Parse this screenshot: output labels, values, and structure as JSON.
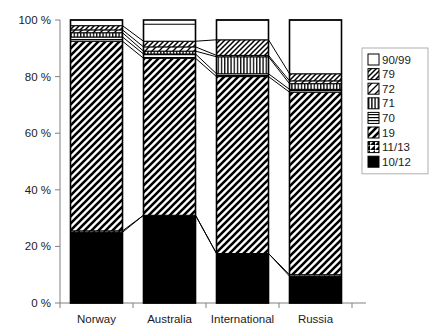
{
  "chart_data": {
    "type": "bar",
    "subtype": "stacked-100-percent",
    "title": "",
    "xlabel": "",
    "ylabel": "",
    "ylim": [
      0,
      100
    ],
    "ytick_labels": [
      "0 %",
      "20 %",
      "40 %",
      "60 %",
      "80 %",
      "100 %"
    ],
    "ytick_values": [
      0,
      20,
      40,
      60,
      80,
      100
    ],
    "grid": false,
    "legend_position": "right",
    "categories": [
      "Norway",
      "Australia",
      "International",
      "Russia"
    ],
    "series": [
      {
        "name": "10/12",
        "pattern": "solid-black",
        "values": [
          25.0,
          31.0,
          17.5,
          9.5
        ]
      },
      {
        "name": "11/13",
        "pattern": "diagonal-half-fill",
        "values": [
          0.5,
          0.0,
          0.0,
          0.5
        ]
      },
      {
        "name": "19",
        "pattern": "diagonal-hatch-dense",
        "values": [
          67.0,
          55.5,
          62.5,
          64.5
        ]
      },
      {
        "name": "70",
        "pattern": "horizontal-lines",
        "values": [
          1.5,
          1.5,
          1.0,
          1.0
        ]
      },
      {
        "name": "71",
        "pattern": "vertical-lines",
        "values": [
          1.5,
          1.0,
          6.0,
          2.0
        ]
      },
      {
        "name": "72",
        "pattern": "diagonal-light",
        "values": [
          1.0,
          1.5,
          0.5,
          1.0
        ]
      },
      {
        "name": "79",
        "pattern": "diagonal-hatch-fine",
        "values": [
          1.5,
          2.0,
          5.5,
          2.5
        ]
      },
      {
        "name": "90/99",
        "pattern": "white-empty",
        "values": [
          2.0,
          6.0,
          7.0,
          19.0
        ]
      }
    ],
    "legend_entries": [
      {
        "label": "90/99",
        "pattern": "white-empty"
      },
      {
        "label": "79",
        "pattern": "diagonal-hatch-fine"
      },
      {
        "label": "72",
        "pattern": "diagonal-light"
      },
      {
        "label": "71",
        "pattern": "vertical-lines"
      },
      {
        "label": "70",
        "pattern": "horizontal-lines"
      },
      {
        "label": "19",
        "pattern": "diagonal-hatch-dense"
      },
      {
        "label": "11/13",
        "pattern": "diagonal-half-fill"
      },
      {
        "label": "10/12",
        "pattern": "solid-black"
      }
    ],
    "colors": {
      "foreground": "#000000",
      "background": "#ffffff",
      "axis": "#808080",
      "text": "#1a1a1a"
    }
  }
}
